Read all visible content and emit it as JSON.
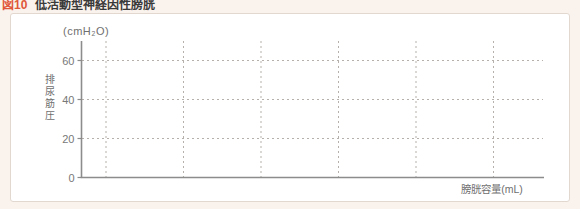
{
  "page": {
    "background": "#faf2ec"
  },
  "figure_header": {
    "label": "図10",
    "title": "低活動型神経因性膀胱"
  },
  "panel": {
    "background": "#ffffff",
    "border_color": "#e3d8d0"
  },
  "chart": {
    "unit_label": "(cmH₂O)",
    "y_axis_label": "排尿筋圧",
    "x_axis_label": "膀胱容量(mL)"
  },
  "colors": {
    "accent": "#e0573a",
    "curve": "#e57f63",
    "axis": "#8c8c8c",
    "grid": "#b5b0ab",
    "tick_text": "#787878"
  },
  "chart_data": {
    "type": "line",
    "title": "低活動型神経因性膀胱",
    "xlabel": "膀胱容量(mL)",
    "ylabel": "排尿筋圧(cmH₂O)",
    "x": [
      0,
      50,
      100,
      150,
      200,
      250,
      300,
      350,
      400,
      450,
      500,
      520
    ],
    "y": [
      1,
      1.8,
      2.7,
      3.6,
      4.6,
      5.7,
      6.9,
      8.1,
      9.5,
      11,
      13,
      14
    ],
    "x_ticks": [
      0,
      100,
      200,
      300,
      400
    ],
    "y_ticks": [
      0,
      20,
      40,
      60
    ],
    "x_gridlines": [
      0,
      100,
      200,
      300,
      400,
      500
    ],
    "y_gridlines": [
      20,
      40,
      60
    ],
    "xlim": [
      0,
      560
    ],
    "ylim": [
      0,
      70
    ],
    "grid": true,
    "legend": false,
    "line_color": "#e57f63"
  }
}
